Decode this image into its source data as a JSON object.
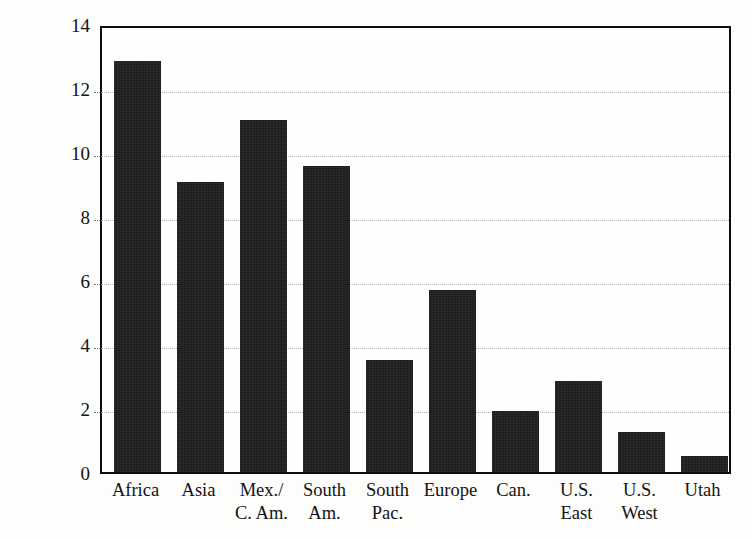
{
  "chart_data": {
    "type": "bar",
    "title": "",
    "xlabel": "",
    "ylabel": "Annual rate of convert baptisms per 100 members",
    "categories": [
      "Africa",
      "Mex./ C. Am.",
      "Asia",
      "South Am.",
      "South Pac.",
      "Europe",
      "Can.",
      "U.S. East",
      "U.S. West",
      "Utah"
    ],
    "category_lines": [
      [
        "Africa",
        ""
      ],
      [
        "Asia",
        ""
      ],
      [
        "Mex./",
        "C. Am."
      ],
      [
        "South",
        "Am."
      ],
      [
        "South",
        "Pac."
      ],
      [
        "Europe",
        ""
      ],
      [
        "Can.",
        ""
      ],
      [
        "U.S.",
        "East"
      ],
      [
        "U.S.",
        "West"
      ],
      [
        "Utah",
        ""
      ]
    ],
    "values": [
      12.85,
      9.05,
      11.0,
      9.55,
      3.5,
      5.7,
      1.9,
      2.85,
      1.25,
      0.5
    ],
    "ylim": [
      0,
      14
    ],
    "yticks": [
      0,
      2,
      4,
      6,
      8,
      10,
      12,
      14
    ],
    "ytick_labels": [
      "0",
      "2",
      "4",
      "6",
      "8",
      "10",
      "12",
      "14"
    ],
    "gridlines": [
      2,
      4,
      6,
      8,
      10,
      12
    ],
    "grid": true,
    "legend": "none",
    "bar_color": "#1c1c1c",
    "grid_color": "#b4b4b4",
    "frame_color": "#0d0d0d",
    "background_color": "#fdfdfb"
  }
}
